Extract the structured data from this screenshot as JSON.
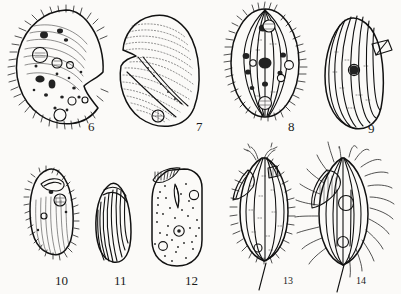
{
  "plate": {
    "title": "Protozoa line-drawing plate",
    "background_color": "#fbfaf8",
    "ink_color": "#111111",
    "style": "black-and-white scientific line engraving",
    "figure_count": 9,
    "rows": 2,
    "columns": 4,
    "number_range": "6-14"
  },
  "figures": [
    {
      "number": "6",
      "row": 1,
      "column": 1,
      "shape": "kidney-bean / reniform with deep lateral notch",
      "ciliation": "dense short cilia around entire margin",
      "interior": "numerous dark granules, large contractile vacuole, food vacuoles, curved striations",
      "label_x": 88,
      "label_y": 131
    },
    {
      "number": "7",
      "row": 1,
      "column": 2,
      "shape": "broad oval with notched anterior margin",
      "ciliation": "none visible; smooth pellicle",
      "interior": "dense oblique stipple striation, oblique groove, small circular vacuole at base",
      "label_x": 196,
      "label_y": 131
    },
    {
      "number": "8",
      "row": 1,
      "column": 3,
      "shape": "ovoid / egg-shaped",
      "ciliation": "short cilia fringing whole outline",
      "interior": "longitudinal kineties (meridional rows), dark granules, central macronucleus",
      "label_x": 288,
      "label_y": 131
    },
    {
      "number": "9",
      "row": 1,
      "column": 4,
      "shape": "elongate oval, slightly curved",
      "ciliation": "none; smooth striated pellicle",
      "interior": "longitudinal striations, single dark nucleus, small rectangular lateral appendage",
      "label_x": 368,
      "label_y": 133
    },
    {
      "number": "10",
      "row": 2,
      "column": 1,
      "shape": "small narrow elongate cell",
      "ciliation": "fine short marginal cilia",
      "interior": "dark striated body, anterior hook, two round vacuoles",
      "label_x": 55,
      "label_y": 285
    },
    {
      "number": "11",
      "row": 2,
      "column": 2,
      "shape": "small narrow bean shape",
      "ciliation": "none",
      "interior": "dense longitudinal striations only",
      "label_x": 114,
      "label_y": 285
    },
    {
      "number": "12",
      "row": 2,
      "column": 3,
      "shape": "rounded rectangular / cylindrical with apical notch",
      "ciliation": "short apical comb of cilia",
      "interior": "stippled cytoplasm, curved pharyngeal rod, three circular vacuoles",
      "label_x": 185,
      "label_y": 285
    },
    {
      "number": "13",
      "row": 2,
      "column": 4,
      "shape": "spindle / teardrop with triangular lateral lobe",
      "ciliation": "stiff bristles on margin, apical flagella tuft, long trailing flagellum",
      "interior": "longitudinal striations, stipple, small basal vacuole",
      "label_x": 283,
      "label_y": 284
    },
    {
      "number": "14",
      "row": 2,
      "column": 4,
      "shape": "ovoid with large triangular lateral lobe",
      "ciliation": "long radiating cilia all around, long trailing flagellum",
      "interior": "longitudinal striations, two large circular vacuoles, hatched lobe",
      "label_x": 356,
      "label_y": 284
    }
  ]
}
